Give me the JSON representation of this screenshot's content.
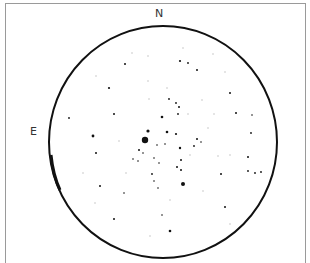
{
  "chart": {
    "labels": {
      "north": "N",
      "east": "E"
    },
    "colors": {
      "circle": "#111111",
      "star": "#111111",
      "faint_star": "#b8b8b8",
      "frame": "#9a9a9a",
      "text": "#333333"
    },
    "circle": {
      "cx": 163,
      "cy": 142,
      "rx": 114,
      "ry": 116
    }
  },
  "chart_data": {
    "type": "scatter",
    "title": "",
    "xlabel": "",
    "ylabel": "",
    "annotations": [
      "N",
      "E"
    ],
    "stars": [
      {
        "x": 125,
        "y": 64,
        "r": 1.0
      },
      {
        "x": 180,
        "y": 61,
        "r": 1.1
      },
      {
        "x": 188,
        "y": 63,
        "r": 0.9
      },
      {
        "x": 197,
        "y": 70,
        "r": 1.0
      },
      {
        "x": 109,
        "y": 88,
        "r": 1.1
      },
      {
        "x": 230,
        "y": 93,
        "r": 1.0
      },
      {
        "x": 169,
        "y": 99,
        "r": 0.9
      },
      {
        "x": 176,
        "y": 103,
        "r": 0.9
      },
      {
        "x": 179,
        "y": 107,
        "r": 1.0
      },
      {
        "x": 178,
        "y": 114,
        "r": 0.9
      },
      {
        "x": 114,
        "y": 114,
        "r": 1.0
      },
      {
        "x": 69,
        "y": 118,
        "r": 0.9
      },
      {
        "x": 162,
        "y": 117,
        "r": 1.3
      },
      {
        "x": 236,
        "y": 113,
        "r": 1.0
      },
      {
        "x": 252,
        "y": 115,
        "r": 0.8
      },
      {
        "x": 93,
        "y": 136,
        "r": 1.4
      },
      {
        "x": 145,
        "y": 140,
        "r": 3.2
      },
      {
        "x": 148,
        "y": 131,
        "r": 1.6
      },
      {
        "x": 167,
        "y": 132,
        "r": 1.3
      },
      {
        "x": 176,
        "y": 134,
        "r": 1.1
      },
      {
        "x": 157,
        "y": 145,
        "r": 0.8
      },
      {
        "x": 165,
        "y": 144,
        "r": 0.8
      },
      {
        "x": 180,
        "y": 148,
        "r": 1.2
      },
      {
        "x": 194,
        "y": 146,
        "r": 0.9
      },
      {
        "x": 197,
        "y": 139,
        "r": 1.0
      },
      {
        "x": 201,
        "y": 142,
        "r": 0.8
      },
      {
        "x": 139,
        "y": 150,
        "r": 1.0
      },
      {
        "x": 143,
        "y": 153,
        "r": 0.8
      },
      {
        "x": 96,
        "y": 153,
        "r": 1.0
      },
      {
        "x": 133,
        "y": 159,
        "r": 0.8
      },
      {
        "x": 138,
        "y": 161,
        "r": 0.8
      },
      {
        "x": 154,
        "y": 158,
        "r": 0.8
      },
      {
        "x": 159,
        "y": 163,
        "r": 0.8
      },
      {
        "x": 181,
        "y": 160,
        "r": 1.0
      },
      {
        "x": 177,
        "y": 167,
        "r": 1.0
      },
      {
        "x": 181,
        "y": 170,
        "r": 1.0
      },
      {
        "x": 152,
        "y": 174,
        "r": 0.9
      },
      {
        "x": 154,
        "y": 181,
        "r": 0.8
      },
      {
        "x": 183,
        "y": 184,
        "r": 2.0
      },
      {
        "x": 100,
        "y": 186,
        "r": 1.0
      },
      {
        "x": 158,
        "y": 188,
        "r": 0.8
      },
      {
        "x": 221,
        "y": 174,
        "r": 1.0
      },
      {
        "x": 124,
        "y": 193,
        "r": 0.8
      },
      {
        "x": 225,
        "y": 207,
        "r": 1.0
      },
      {
        "x": 162,
        "y": 215,
        "r": 0.8
      },
      {
        "x": 114,
        "y": 219,
        "r": 1.0
      },
      {
        "x": 170,
        "y": 231,
        "r": 1.3
      },
      {
        "x": 248,
        "y": 157,
        "r": 1.0
      },
      {
        "x": 248,
        "y": 171,
        "r": 0.9
      },
      {
        "x": 255,
        "y": 173,
        "r": 0.9
      },
      {
        "x": 261,
        "y": 172,
        "r": 0.9
      },
      {
        "x": 251,
        "y": 133,
        "r": 0.9
      }
    ],
    "faint_stars": [
      {
        "x": 132,
        "y": 53
      },
      {
        "x": 148,
        "y": 56
      },
      {
        "x": 183,
        "y": 48
      },
      {
        "x": 213,
        "y": 54
      },
      {
        "x": 225,
        "y": 72
      },
      {
        "x": 96,
        "y": 76
      },
      {
        "x": 148,
        "y": 81
      },
      {
        "x": 167,
        "y": 88
      },
      {
        "x": 149,
        "y": 99
      },
      {
        "x": 202,
        "y": 100
      },
      {
        "x": 188,
        "y": 114
      },
      {
        "x": 214,
        "y": 114
      },
      {
        "x": 95,
        "y": 203
      },
      {
        "x": 83,
        "y": 173
      },
      {
        "x": 218,
        "y": 156
      },
      {
        "x": 203,
        "y": 191
      },
      {
        "x": 150,
        "y": 236
      },
      {
        "x": 230,
        "y": 224
      },
      {
        "x": 126,
        "y": 173
      },
      {
        "x": 190,
        "y": 155
      },
      {
        "x": 208,
        "y": 128
      },
      {
        "x": 119,
        "y": 141
      },
      {
        "x": 230,
        "y": 155
      },
      {
        "x": 170,
        "y": 200
      }
    ]
  }
}
